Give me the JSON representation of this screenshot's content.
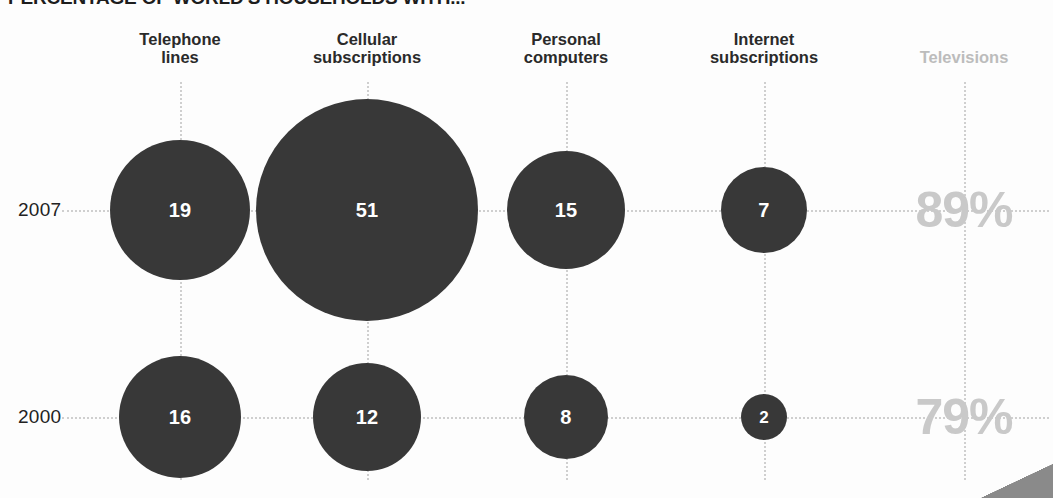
{
  "chart_data": {
    "type": "bubble",
    "title": "PERCENTAGE OF WORLD'S HOUSEHOLDS WITH...",
    "xlabel": "",
    "ylabel": "",
    "grid": true,
    "legend": "none",
    "categories": [
      "Telephone lines",
      "Cellular subscriptions",
      "Personal computers",
      "Internet subscriptions",
      "Televisions"
    ],
    "rows": [
      "2007",
      "2000"
    ],
    "series": [
      {
        "name": "2007",
        "values": [
          19,
          51,
          15,
          7,
          89
        ]
      },
      {
        "name": "2000",
        "values": [
          16,
          12,
          8,
          2,
          79
        ]
      }
    ],
    "value_unit": "percent"
  },
  "header": {
    "title": "PERCENTAGE OF WORLD'S HOUSEHOLDS WITH..."
  },
  "columns": [
    {
      "id": "telephone-lines",
      "label": "Telephone\nlines",
      "x": 180,
      "muted": false
    },
    {
      "id": "cellular-subscriptions",
      "label": "Cellular\nsubscriptions",
      "x": 367,
      "muted": false
    },
    {
      "id": "personal-computers",
      "label": "Personal\ncomputers",
      "x": 566,
      "muted": false
    },
    {
      "id": "internet-subscriptions",
      "label": "Internet\nsubscriptions",
      "x": 764,
      "muted": false
    },
    {
      "id": "televisions",
      "label": "Televisions",
      "x": 964,
      "muted": true
    }
  ],
  "rows": [
    {
      "id": "2007",
      "label": "2007",
      "y": 210
    },
    {
      "id": "2000",
      "label": "2000",
      "y": 417
    }
  ],
  "bubbles": [
    {
      "id": "telephone-lines-2007",
      "column": "telephone-lines",
      "row": "2007",
      "value": "19",
      "cx": 180,
      "cy": 210,
      "d": 140
    },
    {
      "id": "cellular-subscriptions-2007",
      "column": "cellular-subscriptions",
      "row": "2007",
      "value": "51",
      "cx": 367,
      "cy": 210,
      "d": 222
    },
    {
      "id": "personal-computers-2007",
      "column": "personal-computers",
      "row": "2007",
      "value": "15",
      "cx": 566,
      "cy": 210,
      "d": 118
    },
    {
      "id": "internet-subscriptions-2007",
      "column": "internet-subscriptions",
      "row": "2007",
      "value": "7",
      "cx": 764,
      "cy": 210,
      "d": 86
    },
    {
      "id": "telephone-lines-2000",
      "column": "telephone-lines",
      "row": "2000",
      "value": "16",
      "cx": 180,
      "cy": 417,
      "d": 122
    },
    {
      "id": "cellular-subscriptions-2000",
      "column": "cellular-subscriptions",
      "row": "2000",
      "value": "12",
      "cx": 367,
      "cy": 417,
      "d": 108
    },
    {
      "id": "personal-computers-2000",
      "column": "personal-computers",
      "row": "2000",
      "value": "8",
      "cx": 566,
      "cy": 417,
      "d": 84
    },
    {
      "id": "internet-subscriptions-2000",
      "column": "internet-subscriptions",
      "row": "2000",
      "value": "2",
      "cx": 764,
      "cy": 417,
      "d": 46
    }
  ],
  "percent_values": [
    {
      "id": "televisions-2007",
      "column": "televisions",
      "row": "2007",
      "label": "89%",
      "cx": 964,
      "cy": 210
    },
    {
      "id": "televisions-2000",
      "column": "televisions",
      "row": "2000",
      "label": "79%",
      "cx": 964,
      "cy": 417
    }
  ],
  "colors": {
    "bubble_fill": "#383838",
    "bubble_label": "#ffffff",
    "header_text": "#2a2a2a",
    "muted_text": "#c9c9c9",
    "gridline": "#cfcfcf",
    "background": "#fdfdfd"
  }
}
